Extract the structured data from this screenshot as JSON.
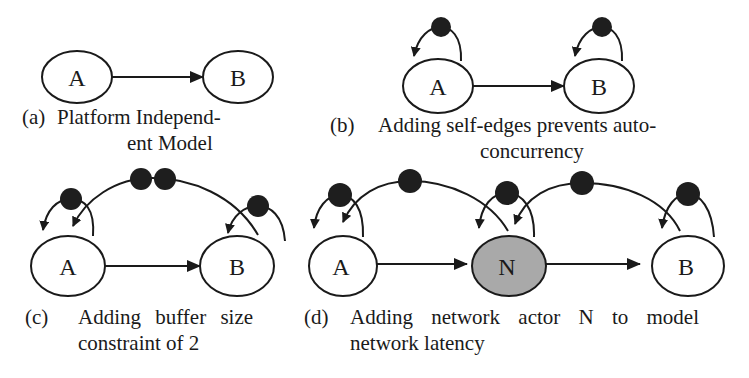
{
  "figure": {
    "subfigures": [
      {
        "id": "a",
        "tag": "(a)",
        "caption_line1": "Platform Independ-",
        "caption_line2": "ent Model",
        "nodes": [
          {
            "label": "A"
          },
          {
            "label": "B"
          }
        ],
        "edges": [
          {
            "from": "A",
            "to": "B",
            "tokens": 0
          }
        ]
      },
      {
        "id": "b",
        "tag": "(b)",
        "caption_line1": "Adding self-edges prevents auto-",
        "caption_line2": "concurrency",
        "nodes": [
          {
            "label": "A"
          },
          {
            "label": "B"
          }
        ],
        "edges": [
          {
            "from": "A",
            "to": "B",
            "tokens": 0
          },
          {
            "from": "A",
            "to": "A",
            "tokens": 1
          },
          {
            "from": "B",
            "to": "B",
            "tokens": 1
          }
        ]
      },
      {
        "id": "c",
        "tag": "(c)",
        "caption_line1": "Adding buffer size",
        "caption_line2": "constraint of 2",
        "nodes": [
          {
            "label": "A"
          },
          {
            "label": "B"
          }
        ],
        "edges": [
          {
            "from": "A",
            "to": "B",
            "tokens": 0
          },
          {
            "from": "A",
            "to": "A",
            "tokens": 1
          },
          {
            "from": "B",
            "to": "B",
            "tokens": 1
          },
          {
            "from": "B",
            "to": "A",
            "tokens": 2
          }
        ]
      },
      {
        "id": "d",
        "tag": "(d)",
        "caption_line1": "Adding network actor N to model",
        "caption_line2": "network latency",
        "nodes": [
          {
            "label": "A"
          },
          {
            "label": "N",
            "fill": "#a9a9a9"
          },
          {
            "label": "B"
          }
        ],
        "edges": [
          {
            "from": "A",
            "to": "N",
            "tokens": 0
          },
          {
            "from": "N",
            "to": "B",
            "tokens": 0
          },
          {
            "from": "A",
            "to": "A",
            "tokens": 1
          },
          {
            "from": "N",
            "to": "N",
            "tokens": 1
          },
          {
            "from": "B",
            "to": "B",
            "tokens": 1
          },
          {
            "from": "N",
            "to": "A",
            "tokens": 1
          },
          {
            "from": "B",
            "to": "N",
            "tokens": 1
          }
        ]
      }
    ],
    "colors": {
      "stroke": "#1a1a1a",
      "token": "#1e1e1e",
      "network_node_fill": "#a9a9a9",
      "background": "#ffffff"
    }
  }
}
